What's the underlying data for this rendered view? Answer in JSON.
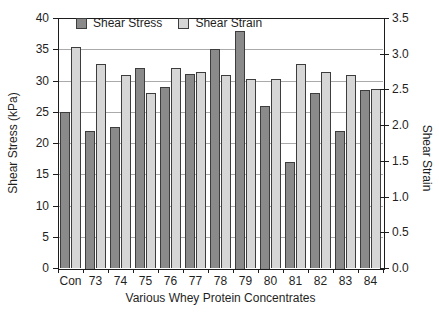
{
  "chart_data": {
    "type": "bar",
    "title": "",
    "xlabel": "Various Whey Protein Concentrates",
    "categories": [
      "Con",
      "73",
      "74",
      "75",
      "76",
      "77",
      "78",
      "79",
      "80",
      "81",
      "82",
      "83",
      "84"
    ],
    "series": [
      {
        "name": "Shear Stress",
        "axis": "left",
        "color": "#8a8a8a",
        "border_color": "#3d3d3d",
        "values": [
          25,
          22,
          22.5,
          32,
          29,
          31,
          35,
          38,
          26,
          17,
          28,
          22,
          28.5
        ]
      },
      {
        "name": "Shear Strain",
        "axis": "right",
        "color": "#d6d6d6",
        "border_color": "#3d3d3d",
        "values": [
          3.1,
          2.85,
          2.7,
          2.45,
          2.8,
          2.75,
          2.7,
          2.65,
          2.65,
          2.85,
          2.75,
          2.7,
          2.5
        ]
      }
    ],
    "left_axis": {
      "label": "Shear Stress (kPa)",
      "min": 0,
      "max": 40,
      "tick_labels": [
        "0",
        "5",
        "10",
        "15",
        "20",
        "25",
        "30",
        "35",
        "40"
      ]
    },
    "right_axis": {
      "label": "Shear Strain",
      "min": 0,
      "max": 3.5,
      "tick_labels": [
        "0.0",
        "0.5",
        "1.0",
        "1.5",
        "2.0",
        "2.5",
        "3.0",
        "3.5"
      ]
    },
    "grid": "horizontal-at-left-ticks",
    "legend_position": "top-inside",
    "colors": {
      "grid": "#aaaaaa",
      "axis": "#1c1c1c",
      "text": "#1f1f1f",
      "background": "#ffffff"
    }
  }
}
